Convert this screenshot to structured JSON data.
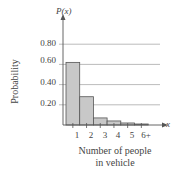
{
  "chart_data": {
    "type": "bar",
    "title": "",
    "xlabel": "Number of people in vehicle",
    "xlabel_lines": [
      "Number of people",
      "in vehicle"
    ],
    "ylabel": "Probability",
    "y_axis_symbol": "P(x)",
    "x_axis_symbol": "x",
    "categories": [
      "1",
      "2",
      "3",
      "4",
      "5",
      "6+"
    ],
    "values": [
      0.62,
      0.28,
      0.07,
      0.04,
      0.02,
      0.01
    ],
    "yticks": [
      "0.20",
      "0.40",
      "0.60",
      "0.80"
    ],
    "ylim": [
      0,
      0.9
    ],
    "grid": true,
    "bar_color": "#c8c8c8",
    "bar_edge_color": "#555555"
  }
}
